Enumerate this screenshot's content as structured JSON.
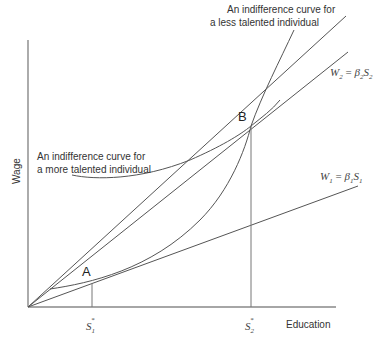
{
  "diagram": {
    "title": "",
    "axes": {
      "x_label": "Education",
      "y_label": "Wage"
    },
    "points": [
      {
        "id": "A",
        "label": "A"
      },
      {
        "id": "B",
        "label": "B"
      }
    ],
    "x_ticks": [
      {
        "symbol": "S",
        "sub": "1",
        "sup": "*"
      },
      {
        "symbol": "S",
        "sub": "2",
        "sup": "*"
      }
    ],
    "annotations": {
      "less_talented_line1": "An indifference curve for",
      "less_talented_line2": "a less talented individual",
      "more_talented_line1": "An indifference curve for",
      "more_talented_line2": "a more talented individual"
    },
    "equations": {
      "w2": {
        "lhs": "W",
        "lhs_sub": "2",
        "eq": " = ",
        "coef": "β",
        "coef_sub": "2",
        "var": "S",
        "var_sub": "2"
      },
      "w1": {
        "lhs": "W",
        "lhs_sub": "1",
        "eq": " = ",
        "coef": "β",
        "coef_sub": "1",
        "var": "S",
        "var_sub": "1"
      }
    },
    "colors": {
      "axis": "#888888",
      "curve": "#555555",
      "text": "#333333"
    }
  }
}
